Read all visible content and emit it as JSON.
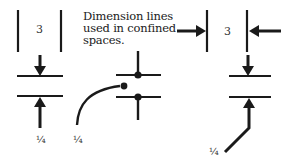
{
  "caption": {
    "lines": [
      "Dimension lines",
      "used in confined",
      "spaces."
    ]
  },
  "labels": {
    "left_dimension": "3",
    "right_dimension": "3",
    "left_fraction": "¼",
    "middle_fraction": "¼",
    "right_fraction": "¼"
  },
  "colors": {
    "line": "#1a1a1a",
    "background": "#ffffff"
  }
}
